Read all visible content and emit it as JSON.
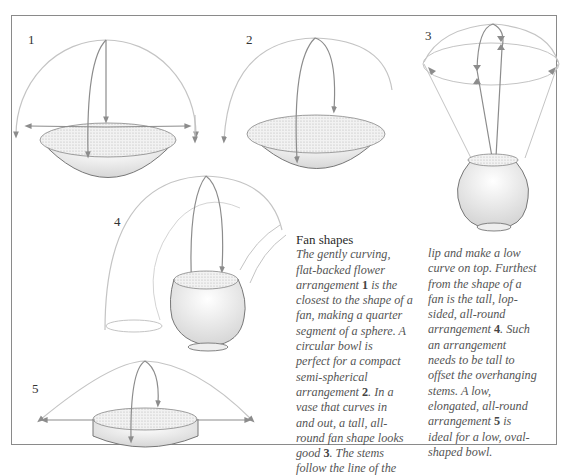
{
  "figures": [
    {
      "number": "1",
      "label": "Flat-backed fan arrangement in shallow bowl"
    },
    {
      "number": "2",
      "label": "Semi-spherical arrangement in circular bowl"
    },
    {
      "number": "3",
      "label": "Tall all-round fan shape in curved vase"
    },
    {
      "number": "4",
      "label": "Tall lop-sided all-round arrangement"
    },
    {
      "number": "5",
      "label": "Low elongated all-round arrangement in oval bowl"
    }
  ],
  "article": {
    "heading": "Fan shapes",
    "column1": {
      "text_a": "The gently curving,\nflat-backed flower\narrangement ",
      "ref1": "1",
      "text_b": " is the\nclosest to the shape of a\nfan, making a quarter\nsegment of a sphere. A\ncircular bowl is\nperfect for a compact\nsemi-spherical\narrangement ",
      "ref2": "2",
      "text_c": ". In a\nvase that curves in\nand out, a tall, all-\nround fan shape looks\ngood ",
      "ref3": "3",
      "text_d": ". The stems\nfollow the line of the"
    },
    "column2": {
      "text_a": "lip and make a low\ncurve on top. Furthest\nfrom the shape of a\nfan is the tall, lop-\nsided, all-round\narrangement ",
      "ref4": "4",
      "text_b": ". Such\nan arrangement\nneeds to be tall to\noffset the overhanging\nstems. A low,\nelongated, all-round\narrangement ",
      "ref5": "5",
      "text_c": " is\nideal for a low, oval-\nshaped bowl."
    }
  },
  "colors": {
    "frame": "#8a8a8a",
    "outline": "#7a7a7a",
    "arrow": "#8c8c8c",
    "shading": "#cfcfcf",
    "text": "#555555"
  }
}
